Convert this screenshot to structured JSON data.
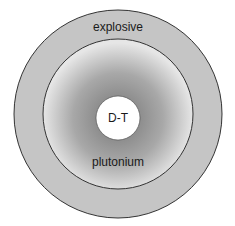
{
  "diagram": {
    "layers": [
      {
        "id": "outer",
        "label": "explosive",
        "fill": "#c5c5c5"
      },
      {
        "id": "middle",
        "label": "plutonium",
        "gradient_inner": "#8a8a8a",
        "gradient_outer": "#e4e4e4"
      },
      {
        "id": "core",
        "label": "D-T",
        "fill": "#ffffff"
      }
    ],
    "stroke": "#333333"
  }
}
